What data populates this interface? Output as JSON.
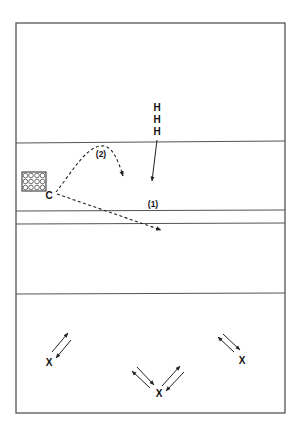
{
  "diagram": {
    "court": {
      "outline": {
        "x1": 16,
        "y1": 23,
        "x2": 285,
        "y2": 413
      },
      "lines_y": [
        142,
        210,
        223,
        293
      ]
    },
    "players": {
      "hitters": [
        {
          "label": "H",
          "x": 157,
          "y": 111
        },
        {
          "label": "H",
          "x": 157,
          "y": 123
        },
        {
          "label": "H",
          "x": 157,
          "y": 135
        }
      ],
      "coach": {
        "label": "C",
        "x": 49,
        "y": 199
      },
      "defenders": [
        {
          "label": "X",
          "x": 49,
          "y": 366
        },
        {
          "label": "X",
          "x": 159,
          "y": 396
        },
        {
          "label": "X",
          "x": 242,
          "y": 363
        }
      ]
    },
    "ball_cart": {
      "x": 22,
      "y": 172,
      "width": 24,
      "height": 19,
      "rows": 3,
      "cols": 4
    },
    "annotations": {
      "ball_1_label": "(1)",
      "ball_2_label": "(2)"
    }
  }
}
